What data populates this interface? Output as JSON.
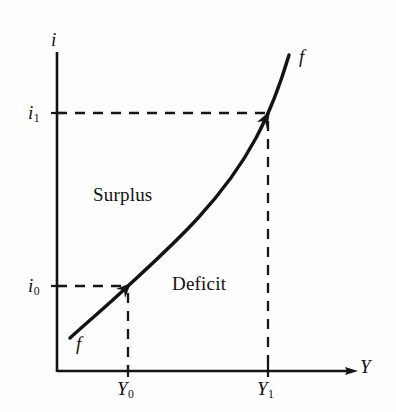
{
  "figure": {
    "type": "economics-diagram",
    "title_text": "",
    "background_color": "#fefefe",
    "ink_color": "#111111"
  },
  "axes": {
    "y_axis": {
      "label": "i",
      "name": "interest-rate-axis",
      "x_px": 57,
      "top_px": 52,
      "bottom_px": 371
    },
    "x_axis": {
      "label": "Y",
      "name": "income-axis",
      "y_px": 371,
      "left_px": 57,
      "right_px": 357
    }
  },
  "ticks": {
    "y": [
      {
        "label": "i",
        "sub": "1",
        "value_px": 113
      },
      {
        "label": "i",
        "sub": "0",
        "value_px": 286
      }
    ],
    "x": [
      {
        "label": "Y",
        "sub": "0",
        "value_px": 128
      },
      {
        "label": "Y",
        "sub": "1",
        "value_px": 268
      }
    ]
  },
  "curve": {
    "name": "ff-schedule",
    "labels": {
      "upper": "f",
      "lower": "f"
    },
    "stroke_color": "#141414",
    "stroke_width": 3.4,
    "points": [
      [
        70,
        338
      ],
      [
        100,
        311
      ],
      [
        128,
        286
      ],
      [
        160,
        258
      ],
      [
        192,
        227
      ],
      [
        222,
        193
      ],
      [
        248,
        154
      ],
      [
        266,
        118
      ],
      [
        280,
        82
      ],
      [
        289,
        55
      ]
    ]
  },
  "guides": [
    {
      "name": "i1-horizontal-guide",
      "orientation": "horizontal",
      "from": [
        57,
        113
      ],
      "to": [
        268,
        113
      ],
      "style": "dashed"
    },
    {
      "name": "i0-horizontal-guide",
      "orientation": "horizontal",
      "from": [
        57,
        286
      ],
      "to": [
        128,
        286
      ],
      "style": "dashed"
    },
    {
      "name": "Y1-vertical-guide",
      "orientation": "vertical",
      "from": [
        268,
        120
      ],
      "to": [
        268,
        371
      ],
      "style": "dashed"
    },
    {
      "name": "Y0-vertical-guide",
      "orientation": "vertical",
      "from": [
        128,
        292
      ],
      "to": [
        128,
        371
      ],
      "style": "dashed"
    }
  ],
  "regions": [
    {
      "name": "surplus-region",
      "label": "Surplus",
      "center_px": [
        140,
        196
      ]
    },
    {
      "name": "deficit-region",
      "label": "Deficit",
      "center_px": [
        208,
        285
      ]
    }
  ],
  "arrowheads": [
    {
      "name": "equilibrium-arrow-low",
      "at_px": [
        128,
        286
      ]
    },
    {
      "name": "equilibrium-arrow-high",
      "at_px": [
        268,
        115
      ]
    },
    {
      "name": "x-axis-arrow",
      "at_px": [
        357,
        371
      ]
    }
  ]
}
